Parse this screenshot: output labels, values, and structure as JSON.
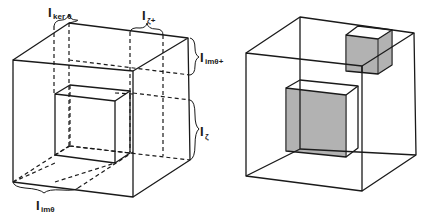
{
  "figure": {
    "left_panel": {
      "description": "Wireframe cube with inner box and dashed partition lines",
      "labels": [
        {
          "id": "ker-theta",
          "main": "I",
          "sub": "ker θ"
        },
        {
          "id": "zeta-plus",
          "main": "I",
          "sub": "ζ+"
        },
        {
          "id": "im-theta-plus",
          "main": "I",
          "sub": "imθ+"
        },
        {
          "id": "zeta",
          "main": "I",
          "sub": "ζ"
        },
        {
          "id": "im-theta",
          "main": "I",
          "sub": "imθ"
        }
      ]
    },
    "right_panel": {
      "description": "Wireframe cube with two hatched sub-boxes"
    }
  }
}
